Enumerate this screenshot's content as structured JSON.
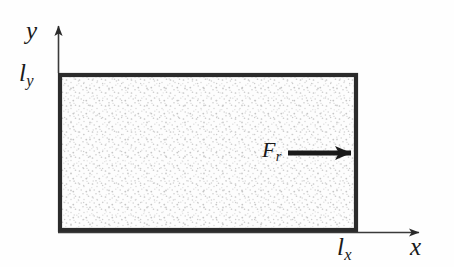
{
  "figure": {
    "background_color": "#fefefe",
    "line_color": "#1a1a1a",
    "fill_color": "#f4f4f4",
    "width": 454,
    "height": 267
  },
  "axes": {
    "y_axis": {
      "label": "y",
      "tick_label": "l",
      "tick_subscript": "y",
      "origin_x": 58,
      "top_y": 20,
      "bottom_y": 73
    },
    "x_axis": {
      "label": "x",
      "tick_label": "l",
      "tick_subscript": "x",
      "origin_y": 232,
      "left_x": 58,
      "right_x": 427
    }
  },
  "domain_rect": {
    "name": "stippled-rectangle",
    "left": 58,
    "top": 73,
    "right": 358,
    "bottom": 232,
    "border_width": 4,
    "fill": "stipple"
  },
  "force": {
    "label": "F",
    "subscript": "r",
    "direction": "right",
    "arrow_start_x": 288,
    "arrow_end_x": 358,
    "arrow_y": 153
  }
}
